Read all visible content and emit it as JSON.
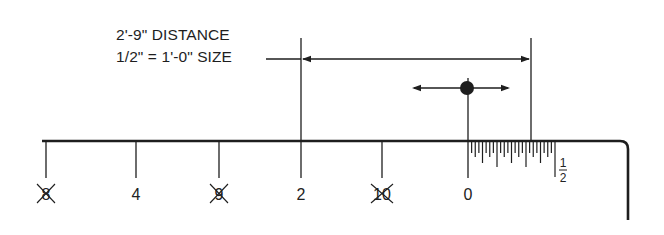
{
  "annotation": {
    "line1": "2'-9\" DISTANCE",
    "line2": "1/2\" = 1'-0\" SIZE"
  },
  "colors": {
    "ink": "#1e1e1e",
    "background": "#ffffff"
  },
  "scale": {
    "baseline_y": 141,
    "start_x": 42,
    "end_x": 620,
    "corner_x": 628,
    "drop_to_y": 220,
    "tick_bottom_y": 178,
    "label_y": 200,
    "major_ticks": [
      {
        "x": 46,
        "label": "8",
        "crossed": true
      },
      {
        "x": 136,
        "label": "4",
        "crossed": false
      },
      {
        "x": 219,
        "label": "9",
        "crossed": true
      },
      {
        "x": 301,
        "label": "2",
        "crossed": false
      },
      {
        "x": 382,
        "label": "10",
        "crossed": true
      },
      {
        "x": 468,
        "label": "0",
        "crossed": false
      }
    ],
    "subdivision": {
      "start_x": 468,
      "end_x": 555,
      "divisions": 24,
      "end_label_numerator": "1",
      "end_label_denominator": "2"
    }
  },
  "dimension": {
    "left_x": 301,
    "right_x": 531,
    "top_y": 38,
    "arrow_y": 59,
    "leader_start_x": 266
  },
  "marker": {
    "x": 467,
    "y": 88,
    "radius": 7,
    "arrow_left_x": 412,
    "arrow_right_x": 510
  }
}
